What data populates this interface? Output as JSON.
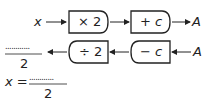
{
  "top_row": {
    "input": "x",
    "box1": "× 2",
    "box2": "+ c",
    "output": "A"
  },
  "bottom_row": {
    "input": "A",
    "box1": "− c",
    "box2": "÷ 2",
    "result_numerator": "............",
    "result_denominator": "2"
  },
  "equation": {
    "lhs": "x =",
    "numerator": "............",
    "denominator": "2"
  }
}
